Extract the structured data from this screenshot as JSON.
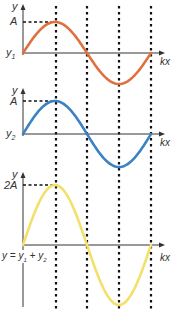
{
  "diagram": {
    "colors": {
      "wave1": "#e0703e",
      "wave2": "#3b82c4",
      "sum": "#f2e06a",
      "axis": "#333333",
      "guide": "#111111"
    },
    "guides_x": [
      56,
      87,
      119,
      151
    ],
    "axis_x": 23,
    "axis_right": 165,
    "panels": [
      {
        "id": "wave1",
        "y_label": "y",
        "amp_label": "A",
        "origin_label": "y1",
        "origin_sub": "1",
        "x_label": "kx",
        "axis_top": 4,
        "baseline": 53,
        "amp_px": 31,
        "color_key": "wave1"
      },
      {
        "id": "wave2",
        "y_label": "y",
        "amp_label": "A",
        "origin_label": "y2",
        "origin_sub": "2",
        "x_label": "kx",
        "axis_top": 88,
        "baseline": 134,
        "amp_px": 33,
        "color_key": "wave2"
      },
      {
        "id": "sum",
        "y_label": "y",
        "amp_label": "2A",
        "origin_label": "y = y1 + y2",
        "x_label": "kx",
        "axis_top": 172,
        "axis_bottom": 307,
        "baseline": 245,
        "amp_px": 60,
        "color_key": "sum"
      }
    ]
  }
}
